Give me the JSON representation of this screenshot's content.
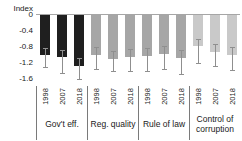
{
  "chart_data": {
    "type": "bar",
    "title": "",
    "ylabel": "Index",
    "xlabel": "",
    "ylim": [
      -1.6,
      0
    ],
    "grid": false,
    "legend": "none",
    "y_ticks": [
      {
        "label": "0",
        "value": 0
      },
      {
        "label": "-0.4",
        "value": -0.4
      },
      {
        "label": "-0.8",
        "value": -0.8
      },
      {
        "label": "-1.2",
        "value": -1.2
      },
      {
        "label": "-1.6",
        "value": -1.6
      }
    ],
    "years": [
      "1998",
      "2007",
      "2018"
    ],
    "groups": [
      {
        "label": "Gov't eff.",
        "bar_color": "#1f1f1f",
        "values": [
          -1.0,
          -1.06,
          -1.29
        ],
        "ci_high": [
          -0.83,
          -0.87,
          -1.08
        ],
        "ci_low": [
          -1.3,
          -1.45,
          -1.6
        ]
      },
      {
        "label": "Reg. quality",
        "bar_color": "#a6a6a6",
        "values": [
          -1.01,
          -1.1,
          -1.06
        ],
        "ci_high": [
          -0.81,
          -0.9,
          -0.86
        ],
        "ci_low": [
          -1.35,
          -1.4,
          -1.41
        ]
      },
      {
        "label": "Rule of law",
        "bar_color": "#a6a6a6",
        "values": [
          -1.04,
          -0.98,
          -1.08
        ],
        "ci_high": [
          -0.84,
          -0.78,
          -0.88
        ],
        "ci_low": [
          -1.41,
          -1.35,
          -1.48
        ]
      },
      {
        "label": "Control of corruption",
        "bar_color": "#c9c9c9",
        "values": [
          -0.79,
          -0.92,
          -1.01
        ],
        "ci_high": [
          -0.62,
          -0.72,
          -0.81
        ],
        "ci_low": [
          -1.21,
          -1.29,
          -1.37
        ]
      }
    ],
    "error_bar_color": "#8f8f8f",
    "axis_line_color": "#a6a6a6",
    "separator_color": "#7a7a7a",
    "text_color": "#1a1a1a"
  }
}
